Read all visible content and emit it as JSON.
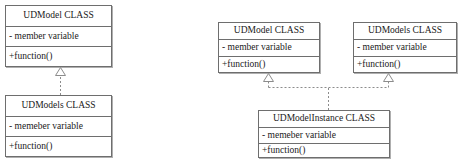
{
  "diagram": {
    "type": "uml-class-diagram",
    "background_color": "#ffffff",
    "border_color": "#6e6e6e",
    "text_color": "#1a1a1a",
    "groups": [
      {
        "id": "left-diagram",
        "classes": [
          {
            "id": "left-udmodel",
            "name": "UDModel CLASS",
            "attribute": "- member variable",
            "operation": "+function()"
          },
          {
            "id": "left-udmodels",
            "name": "UDModels CLASS",
            "attribute": "- memeber variable",
            "operation": "+function()"
          }
        ],
        "relationships": [
          {
            "id": "left-realization",
            "from": "left-udmodels",
            "to": "left-udmodel",
            "style": "dashed",
            "arrowhead": "hollow-triangle",
            "kind": "realization"
          }
        ]
      },
      {
        "id": "right-diagram",
        "classes": [
          {
            "id": "right-udmodel",
            "name": "UDModel CLASS",
            "attribute": "- member variable",
            "operation": "+function()"
          },
          {
            "id": "right-udmodels",
            "name": "UDModels CLASS",
            "attribute": "- member variable",
            "operation": "+function()"
          },
          {
            "id": "right-udmodelinstance",
            "name": "UDModelInstance CLASS",
            "attribute": "- memeber variable",
            "operation": "+function()"
          }
        ],
        "relationships": [
          {
            "id": "right-realization-1",
            "from": "right-udmodelinstance",
            "to": "right-udmodel",
            "style": "dashed",
            "arrowhead": "hollow-triangle",
            "kind": "realization"
          },
          {
            "id": "right-realization-2",
            "from": "right-udmodelinstance",
            "to": "right-udmodels",
            "style": "dashed",
            "arrowhead": "hollow-triangle",
            "kind": "realization"
          }
        ]
      }
    ]
  }
}
